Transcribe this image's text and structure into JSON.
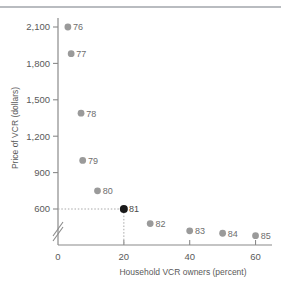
{
  "chart_data": {
    "type": "scatter",
    "title": "",
    "xlabel": "Household VCR owners (percent)",
    "ylabel": "Price of VCR (dollars)",
    "xlim": [
      0,
      65
    ],
    "ylim": [
      330,
      2200
    ],
    "xticks": [
      0,
      20,
      40,
      60
    ],
    "xtick_labels": [
      "0",
      "20",
      "40",
      "60"
    ],
    "yticks": [
      600,
      900,
      1200,
      1500,
      1800,
      2100
    ],
    "ytick_labels": [
      "600",
      "900",
      "1,200",
      "1,500",
      "1,800",
      "2,100"
    ],
    "grid": false,
    "legend": "none",
    "y_axis_break": true,
    "point_labels_note": "two-digit year labels",
    "points": [
      {
        "label": "76",
        "x": 3,
        "y": 2100,
        "highlighted": false
      },
      {
        "label": "77",
        "x": 4,
        "y": 1880,
        "highlighted": false
      },
      {
        "label": "78",
        "x": 7,
        "y": 1390,
        "highlighted": false
      },
      {
        "label": "79",
        "x": 7.5,
        "y": 1000,
        "highlighted": false
      },
      {
        "label": "80",
        "x": 12,
        "y": 750,
        "highlighted": false
      },
      {
        "label": "81",
        "x": 20,
        "y": 600,
        "highlighted": true
      },
      {
        "label": "82",
        "x": 28,
        "y": 480,
        "highlighted": false
      },
      {
        "label": "83",
        "x": 40,
        "y": 420,
        "highlighted": false
      },
      {
        "label": "84",
        "x": 50,
        "y": 400,
        "highlighted": false
      },
      {
        "label": "85",
        "x": 60,
        "y": 380,
        "highlighted": false
      }
    ],
    "reference_lines": [
      {
        "orientation": "horizontal",
        "value": 600,
        "style": "dotted",
        "from_point": "81"
      },
      {
        "orientation": "vertical",
        "value": 20,
        "style": "dotted",
        "from_point": "81"
      }
    ],
    "colors": {
      "marker": "#9a9a9a",
      "marker_highlight": "#1a1a1a",
      "axis": "#8a8a8a",
      "text": "#5a5a5a",
      "rule": "#b9bcc0",
      "guide": "#a8a8a8"
    }
  }
}
